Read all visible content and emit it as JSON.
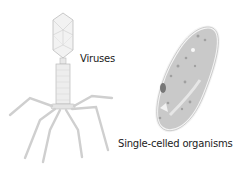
{
  "labels": {
    "virus": "Viruses",
    "single_celled": "Single-celled organisms"
  },
  "colors": {
    "virus_fill": "#eeeeee",
    "virus_stroke": "#bdbdbd",
    "cell_fill": "#c9c9c9",
    "cell_border": "#f3f3f3",
    "text": "#222222"
  }
}
